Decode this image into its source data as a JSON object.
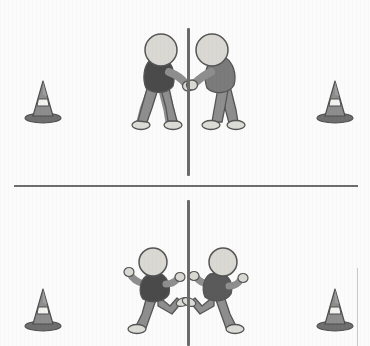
{
  "scene": {
    "title": "Two-panel illustration of figures at a center barrier with traffic cones",
    "panels": [
      {
        "id": "panel-top",
        "label": "Top panel",
        "caption": "Two figures facing each other, hands touching across a vertical pole",
        "figures": [
          {
            "id": "figure-top-left",
            "label": "Left figure leaning toward pole",
            "pose": "leaning-forward-reaching",
            "facing": "right",
            "shirt_color": "#4a4a4a",
            "pants_color": "#8e8e8e",
            "skin_color": "#d9d8d2",
            "shoe_color": "#dcdcd6",
            "outline_color": "#555555"
          },
          {
            "id": "figure-top-right",
            "label": "Right figure leaning toward pole",
            "pose": "leaning-forward-reaching",
            "facing": "left",
            "shirt_color": "#7b7b7b",
            "pants_color": "#8e8e8e",
            "skin_color": "#d9d8d2",
            "shoe_color": "#dcdcd6",
            "outline_color": "#555555"
          }
        ],
        "cones": [
          {
            "id": "cone-top-left",
            "label": "Traffic cone left",
            "body_color": "#8d8d8d",
            "stripe_color": "#f2f2ee",
            "base_color": "#6f6f6f"
          },
          {
            "id": "cone-top-right",
            "label": "Traffic cone right",
            "body_color": "#8d8d8d",
            "stripe_color": "#f2f2ee",
            "base_color": "#6f6f6f"
          }
        ],
        "pole": {
          "id": "pole-top",
          "label": "Vertical barrier pole",
          "color": "#6b6b6b"
        }
      },
      {
        "id": "panel-bottom",
        "label": "Bottom panel",
        "caption": "Two figures running away from the center pole in opposite directions",
        "figures": [
          {
            "id": "figure-bottom-left",
            "label": "Left figure running left",
            "pose": "running",
            "facing": "left",
            "shirt_color": "#4a4a4a",
            "pants_color": "#8e8e8e",
            "skin_color": "#d9d8d2",
            "shoe_color": "#dcdcd6",
            "outline_color": "#555555"
          },
          {
            "id": "figure-bottom-right",
            "label": "Right figure running right",
            "pose": "running",
            "facing": "right",
            "shirt_color": "#5a5a5a",
            "pants_color": "#8e8e8e",
            "skin_color": "#d9d8d2",
            "shoe_color": "#dcdcd6",
            "outline_color": "#555555"
          }
        ],
        "cones": [
          {
            "id": "cone-bottom-left",
            "label": "Traffic cone left",
            "body_color": "#8d8d8d",
            "stripe_color": "#f2f2ee",
            "base_color": "#6f6f6f"
          },
          {
            "id": "cone-bottom-right",
            "label": "Traffic cone right",
            "body_color": "#8d8d8d",
            "stripe_color": "#f2f2ee",
            "base_color": "#6f6f6f"
          }
        ],
        "pole": {
          "id": "pole-bottom",
          "label": "Vertical barrier pole",
          "color": "#6b6b6b"
        }
      }
    ],
    "divider": {
      "label": "Panel divider line",
      "color": "#6e6e6e"
    },
    "background_color": "#fbfbfb"
  }
}
